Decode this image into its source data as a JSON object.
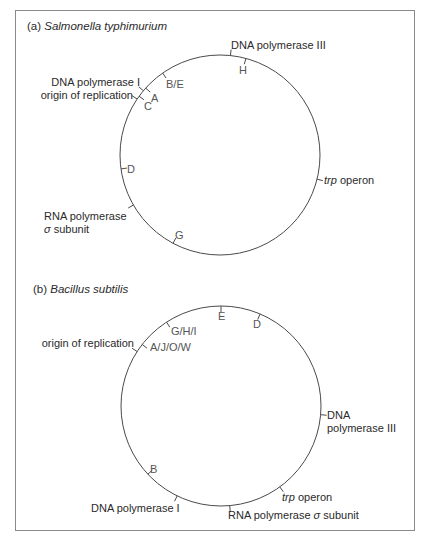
{
  "figure": {
    "panels": [
      {
        "id": "a",
        "prefix": "(a) ",
        "organism": "Salmonella typhimurium",
        "circle": {
          "cx": 220,
          "cy": 155,
          "r": 100
        },
        "gene_labels": {
          "dna_pol_iii": "DNA polymerase III",
          "dna_pol_i": "DNA polymerase I",
          "origin": "origin of replication",
          "trp_italic": "trp",
          "trp_rest": " operon",
          "rna_pol_line1": "RNA polymerase",
          "rna_pol_sigma": "σ",
          "rna_pol_line2_rest": " subunit"
        },
        "markers": {
          "H": "H",
          "BE": "B/E",
          "A": "A",
          "C": "C",
          "D": "D",
          "G": "G"
        },
        "ticks": [
          {
            "name": "dna-pol-iii",
            "angle": 6,
            "side": "out"
          },
          {
            "name": "H",
            "angle": 15,
            "side": "in"
          },
          {
            "name": "B/E",
            "angle": -35,
            "side": "in"
          },
          {
            "name": "dna-pol-i",
            "angle": -50,
            "side": "out"
          },
          {
            "name": "A",
            "angle": -48,
            "side": "in"
          },
          {
            "name": "origin",
            "angle": -56,
            "side": "out"
          },
          {
            "name": "C",
            "angle": -54,
            "side": "in"
          },
          {
            "name": "D",
            "angle": -98,
            "side": "in"
          },
          {
            "name": "rna-pol-sigma",
            "angle": -120,
            "side": "out"
          },
          {
            "name": "G",
            "angle": -152,
            "side": "in"
          },
          {
            "name": "trp-operon",
            "angle": 104,
            "side": "out"
          }
        ]
      },
      {
        "id": "b",
        "prefix": "(b) ",
        "organism": "Bacillus subtilis",
        "circle": {
          "cx": 221,
          "cy": 406,
          "r": 100
        },
        "gene_labels": {
          "origin": "origin of replication",
          "dna_pol_iii_line1": "DNA",
          "dna_pol_iii_line2": "polymerase III",
          "trp_italic": "trp",
          "trp_rest": " operon",
          "rna_pol_prefix": "RNA polymerase ",
          "rna_pol_sigma": "σ",
          "rna_pol_suffix": " subunit",
          "dna_pol_i": "DNA polymerase I"
        },
        "markers": {
          "E": "E",
          "D": "D",
          "GHI": "G/H/I",
          "AJOW": "A/J/O/W",
          "B": "B"
        },
        "ticks": [
          {
            "name": "E",
            "angle": 0,
            "side": "in"
          },
          {
            "name": "D",
            "angle": 23,
            "side": "in"
          },
          {
            "name": "G/H/I",
            "angle": -33,
            "side": "in"
          },
          {
            "name": "A/J/O/W",
            "angle": -52,
            "side": "in"
          },
          {
            "name": "origin",
            "angle": -57,
            "side": "out"
          },
          {
            "name": "dna-pol-iii",
            "angle": 95,
            "side": "out"
          },
          {
            "name": "trp-operon",
            "angle": 144,
            "side": "out"
          },
          {
            "name": "rna-pol-sigma",
            "angle": 175,
            "side": "out"
          },
          {
            "name": "dna-pol-i",
            "angle": 206,
            "side": "out"
          },
          {
            "name": "B",
            "angle": 227,
            "side": "in"
          }
        ]
      }
    ],
    "colors": {
      "circle_stroke": "#4a4a4a",
      "frame": "#8a8a8a",
      "text": "#2a2a2a",
      "marker_text": "#555555"
    }
  }
}
